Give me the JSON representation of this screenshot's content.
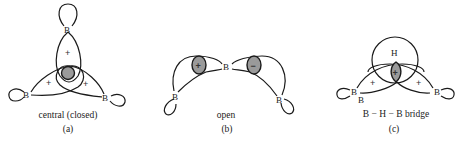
{
  "figure": {
    "panels": [
      {
        "id": "a",
        "caption": "central (closed)",
        "letter": "(a)",
        "atoms": [
          "B",
          "B",
          "B"
        ],
        "lobe_signs": [
          "+",
          "+",
          "+"
        ],
        "center_sign": ""
      },
      {
        "id": "b",
        "caption": "open",
        "letter": "(b)",
        "atoms": [
          "B",
          "B",
          "B"
        ],
        "lobe_signs": [
          "+",
          "−"
        ]
      },
      {
        "id": "c",
        "caption": "B − H − B  bridge",
        "letter": "(c)",
        "atoms": [
          "H",
          "B",
          "B",
          "B"
        ],
        "lobe_signs": [
          "+",
          "+"
        ],
        "center_sign": "+"
      }
    ],
    "colors": {
      "line": "#1a1a1a",
      "shade": "#9a9a9a",
      "background": "#ffffff"
    }
  }
}
